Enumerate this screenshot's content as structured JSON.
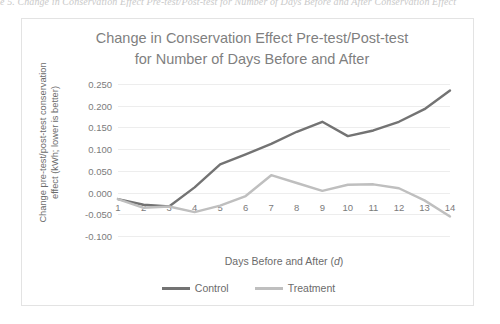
{
  "page": {
    "caption_fragment": "e 5. Change in Conservation Effect Pre-test/Post-test for Number of Days Before and After Conservation Effect"
  },
  "chart_data": {
    "type": "line",
    "title": "Change in Conservation Effect Pre-test/Post-test for Number of Days Before and After",
    "title_lines": [
      "Change in Conservation Effect Pre-test/Post-test",
      "for Number of Days Before and After"
    ],
    "xlabel": "Days Before and After (d)",
    "xlabel_plain": "Days Before and After",
    "xlabel_italic": "d",
    "ylabel": "Change pre-test/post-test conservation effect (kWh; lower is better)",
    "ylabel_lines": [
      "Change pre-test/post-test conservation",
      "effect (kWh; lower is better)"
    ],
    "x": [
      1,
      2,
      3,
      4,
      5,
      6,
      7,
      8,
      9,
      10,
      11,
      12,
      13,
      14
    ],
    "categories": [
      "1",
      "2",
      "3",
      "4",
      "5",
      "6",
      "7",
      "8",
      "9",
      "10",
      "11",
      "12",
      "13",
      "14"
    ],
    "ylim": [
      -0.1,
      0.25
    ],
    "yticks": [
      0.25,
      0.2,
      0.15,
      0.1,
      0.05,
      0.0,
      -0.05,
      -0.1
    ],
    "ytick_labels": [
      "0.250",
      "0.200",
      "0.150",
      "0.100",
      "0.050",
      "0.000",
      "-0.050",
      "-0.100"
    ],
    "grid": true,
    "legend_position": "bottom",
    "series": [
      {
        "name": "Control",
        "color": "#737373",
        "values": [
          -0.015,
          -0.028,
          -0.032,
          0.012,
          0.065,
          0.088,
          0.112,
          0.14,
          0.163,
          0.13,
          0.143,
          0.163,
          0.192,
          0.235
        ]
      },
      {
        "name": "Treatment",
        "color": "#bfbfbf",
        "values": [
          -0.015,
          -0.035,
          -0.032,
          -0.045,
          -0.03,
          -0.008,
          0.04,
          0.022,
          0.004,
          0.018,
          0.019,
          0.01,
          -0.018,
          -0.055
        ]
      }
    ]
  }
}
